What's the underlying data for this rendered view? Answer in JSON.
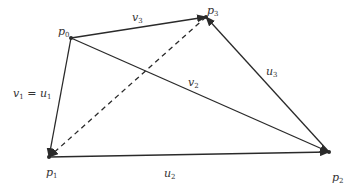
{
  "diagram": {
    "points": [
      {
        "id": "p0",
        "label": "p",
        "sub": "0",
        "x": 71,
        "y": 38,
        "lx": 58,
        "ly": 35
      },
      {
        "id": "p1",
        "label": "p",
        "sub": "1",
        "x": 49,
        "y": 157,
        "lx": 46,
        "ly": 176
      },
      {
        "id": "p2",
        "label": "p",
        "sub": "2",
        "x": 329,
        "y": 152,
        "lx": 332,
        "ly": 181
      },
      {
        "id": "p3",
        "label": "p",
        "sub": "3",
        "x": 206,
        "y": 17,
        "lx": 207,
        "ly": 14
      }
    ],
    "edges": [
      {
        "id": "v1_u1",
        "from": "p0",
        "to": "p1",
        "style": "solid",
        "arrow": true
      },
      {
        "id": "v3",
        "from": "p0",
        "to": "p3",
        "style": "solid",
        "arrow": true
      },
      {
        "id": "v2",
        "from": "p0",
        "to": "p2",
        "style": "solid",
        "arrow": true
      },
      {
        "id": "u2",
        "from": "p1",
        "to": "p2",
        "style": "solid",
        "arrow": true
      },
      {
        "id": "u3",
        "from": "p2",
        "to": "p3",
        "style": "solid",
        "arrow": true
      },
      {
        "id": "diag",
        "from": "p3",
        "to": "p1",
        "style": "dashed",
        "arrow": true
      }
    ],
    "edge_labels": [
      {
        "id": "v3",
        "label": "v",
        "sub": "3",
        "x": 132,
        "y": 21
      },
      {
        "id": "v2",
        "label": "v",
        "sub": "2",
        "x": 188,
        "y": 86
      },
      {
        "id": "u3",
        "label": "u",
        "sub": "3",
        "x": 266,
        "y": 75
      },
      {
        "id": "u2",
        "label": "u",
        "sub": "2",
        "x": 164,
        "y": 177
      },
      {
        "id": "v1_u1",
        "label_left": "v",
        "sub_left": "1",
        "eq": " = ",
        "label_right": "u",
        "sub_right": "1",
        "x": 13,
        "y": 97
      }
    ],
    "colors": {
      "line": "#2a2a2a",
      "text": "#333333",
      "background": "#ffffff"
    }
  }
}
